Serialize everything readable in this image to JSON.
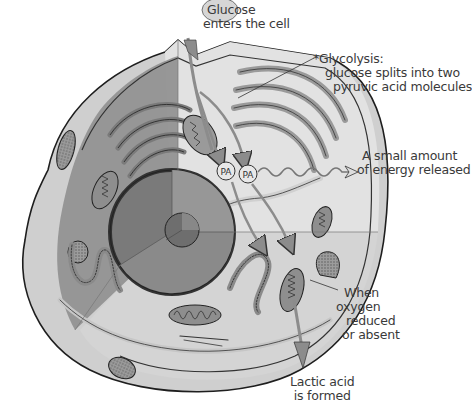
{
  "diagram": {
    "type": "cell-cutaway-illustration",
    "colors": {
      "cytoplasm_outer": "#c9c9c9",
      "cytoplasm_inner": "#dcdcdc",
      "cutaway_dark": "#8a8a8a",
      "nucleus": "#6f6f6f",
      "organelle": "#9a9a9a",
      "outline": "#2a2a2a",
      "arrow": "#8c8c8c",
      "text": "#3a3a3a"
    },
    "labels": {
      "glucose": [
        "Glucose",
        "enters the cell"
      ],
      "glycolysis": [
        "*Glycolysis:",
        "glucose splits into two",
        "pyruvic acid molecules"
      ],
      "energy": [
        "A small amount",
        "of energy released"
      ],
      "oxygen": [
        "When",
        "oxygen",
        "reduced",
        "or absent"
      ],
      "lactic": [
        "Lactic acid",
        "is formed"
      ]
    },
    "markers": {
      "pa1": "PA",
      "pa2": "PA"
    }
  }
}
